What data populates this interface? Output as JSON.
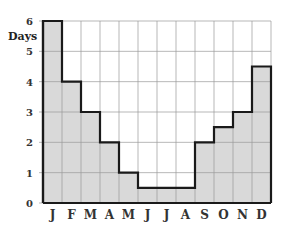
{
  "chart_data": {
    "type": "bar",
    "title": "",
    "xlabel": "",
    "ylabel": "Days",
    "categories": [
      "J",
      "F",
      "M",
      "A",
      "M",
      "J",
      "J",
      "A",
      "S",
      "O",
      "N",
      "D"
    ],
    "values": [
      6,
      4,
      3,
      2,
      1,
      0.5,
      0.5,
      0.5,
      2,
      2.5,
      3,
      4.5
    ],
    "ylim": [
      0,
      6
    ],
    "yticks": [
      0,
      1,
      2,
      3,
      4,
      5,
      6
    ],
    "grid": true,
    "legend": null,
    "style": "step-histogram",
    "colors": {
      "fill": "#d9d9d9",
      "outline": "#1a1a1a",
      "grid": "#9a9a9a"
    }
  }
}
